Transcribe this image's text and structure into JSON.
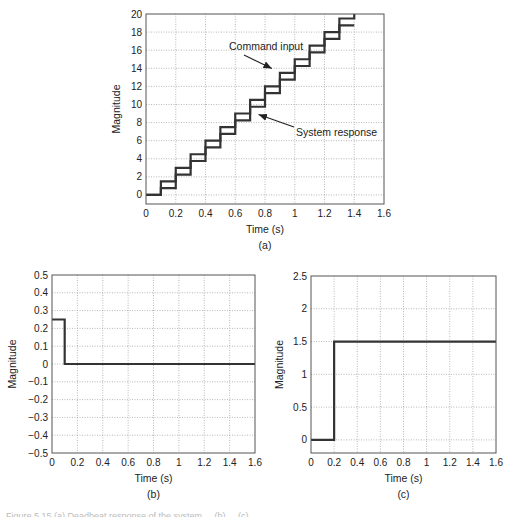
{
  "chart_data": [
    {
      "id": "a",
      "type": "line",
      "subtitle": "(a)",
      "xlabel": "Time (s)",
      "ylabel": "Magnitude",
      "xlim": [
        0,
        1.6
      ],
      "ylim": [
        -1,
        20
      ],
      "xticks": [
        "0",
        "0.2",
        "0.4",
        "0.6",
        "0.8",
        "1",
        "1.2",
        "1.4",
        "1.6"
      ],
      "yticks": [
        "0",
        "2",
        "4",
        "6",
        "8",
        "10",
        "12",
        "14",
        "16",
        "18",
        "20"
      ],
      "grid": true,
      "series": [
        {
          "name": "Command input",
          "step": true,
          "x": [
            0,
            0.1,
            0.2,
            0.3,
            0.4,
            0.5,
            0.6,
            0.7,
            0.8,
            0.9,
            1.0,
            1.1,
            1.2,
            1.3,
            1.4
          ],
          "values": [
            0,
            1.5,
            3,
            4.5,
            6,
            7.5,
            9,
            10.5,
            12,
            13.5,
            15,
            16.5,
            18,
            19.5,
            20
          ]
        },
        {
          "name": "System response",
          "step": true,
          "x": [
            0,
            0.1,
            0.2,
            0.3,
            0.4,
            0.5,
            0.6,
            0.7,
            0.8,
            0.9,
            1.0,
            1.1,
            1.2,
            1.3,
            1.4
          ],
          "values": [
            0,
            0.75,
            2.25,
            3.75,
            5.25,
            6.75,
            8.25,
            9.75,
            11.25,
            12.75,
            14.25,
            15.75,
            17.25,
            18.75,
            18.75
          ]
        }
      ],
      "annotations": [
        {
          "text": "Command input",
          "arrow_to": [
            0.9,
            14.2
          ]
        },
        {
          "text": "System response",
          "arrow_to": [
            0.73,
            9.0
          ]
        }
      ]
    },
    {
      "id": "b",
      "type": "line",
      "subtitle": "(b)",
      "xlabel": "Time (s)",
      "ylabel": "Magnitude",
      "xlim": [
        0,
        1.6
      ],
      "ylim": [
        -0.5,
        0.5
      ],
      "xticks": [
        "0",
        "0.2",
        "0.4",
        "0.6",
        "0.8",
        "1",
        "1.2",
        "1.4",
        "1.6"
      ],
      "yticks": [
        "−0.5",
        "−0.4",
        "−0.3",
        "−0.2",
        "−0.1",
        "0",
        "0.1",
        "0.2",
        "0.3",
        "0.4",
        "0.5"
      ],
      "grid": true,
      "series": [
        {
          "name": "signal",
          "step": true,
          "x": [
            0,
            0.1,
            1.6
          ],
          "values": [
            0.25,
            0,
            0
          ]
        }
      ]
    },
    {
      "id": "c",
      "type": "line",
      "subtitle": "(c)",
      "xlabel": "Time (s)",
      "ylabel": "Magnitude",
      "xlim": [
        0,
        1.6
      ],
      "ylim": [
        -0.2,
        2.5
      ],
      "xticks": [
        "0",
        "0.2",
        "0.4",
        "0.6",
        "0.8",
        "1",
        "1.2",
        "1.4",
        "1.6"
      ],
      "yticks": [
        "0",
        "0.5",
        "1",
        "1.5",
        "2",
        "2.5"
      ],
      "grid": true,
      "series": [
        {
          "name": "signal",
          "step": true,
          "x": [
            0,
            0.2,
            1.6
          ],
          "values": [
            0,
            1.5,
            1.5
          ]
        }
      ]
    }
  ],
  "caption": "Figure 5.15 (a) Deadbeat response of the system ... (b) ... (c) ..."
}
